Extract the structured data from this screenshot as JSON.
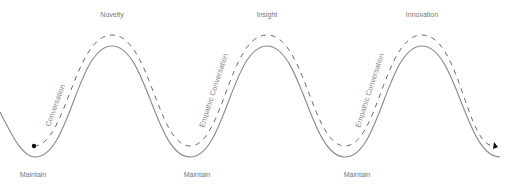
{
  "diagram": {
    "peaks": [
      {
        "label": "Novelty",
        "x": 112
      },
      {
        "label": "Insight",
        "x": 267
      },
      {
        "label": "Innovation",
        "x": 422
      }
    ],
    "troughs": [
      {
        "label": "Maintain",
        "x": 35
      },
      {
        "label": "Maintain",
        "x": 190
      },
      {
        "label": "Maintain",
        "x": 345
      }
    ],
    "path_labels": [
      {
        "label": "Conversation"
      },
      {
        "label": "Empathic Conversation"
      },
      {
        "label": "Empathic Conversation"
      }
    ],
    "colors": {
      "solid_line": "#8a8a8a",
      "dashed_line": "#6a6a6a",
      "text": "#777777",
      "marker": "#111111"
    },
    "start_marker": "filled-dot",
    "end_marker": "arrowhead"
  }
}
